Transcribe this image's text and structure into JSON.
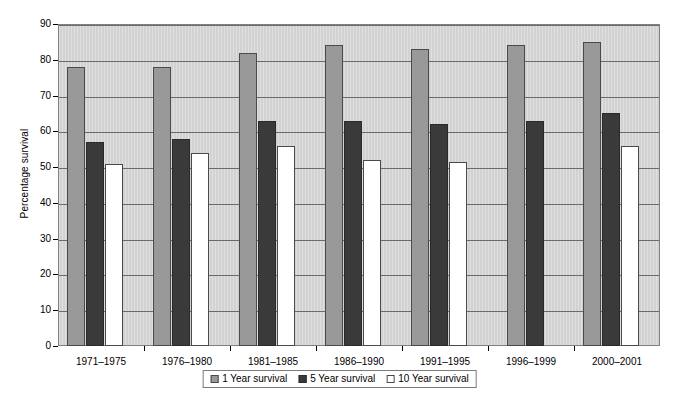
{
  "chart_data": {
    "type": "bar",
    "title": "",
    "xlabel": "",
    "ylabel": "Percentage survival",
    "ylim": [
      0,
      90
    ],
    "ytick_step": 10,
    "yticks": [
      0,
      10,
      20,
      30,
      40,
      50,
      60,
      70,
      80,
      90
    ],
    "ytick_labels": [
      "0",
      "10",
      "20",
      "30",
      "40",
      "50",
      "60",
      "70",
      "80",
      "90"
    ],
    "grid": true,
    "grid_axis": "y",
    "legend_position": "bottom-center",
    "categories": [
      "1971–1975",
      "1976–1980",
      "1981–1985",
      "1986–1990",
      "1991–1995",
      "1996–1999",
      "2000–2001"
    ],
    "series": [
      {
        "name": "1 Year survival",
        "color": "#999999",
        "values": [
          78,
          78,
          82,
          84,
          83,
          84,
          85
        ]
      },
      {
        "name": "5 Year survival",
        "color": "#3a3a3a",
        "values": [
          57,
          58,
          63,
          63,
          62,
          63,
          65
        ]
      },
      {
        "name": "10 Year survival",
        "color": "#ffffff",
        "values": [
          51,
          54,
          56,
          52,
          51.5,
          null,
          56
        ]
      }
    ],
    "plot_background": "#d2d2d2",
    "axis_color": "#000000",
    "gridline_color": "#6b6b6b"
  },
  "legend": {
    "items": [
      {
        "label": "1 Year survival",
        "swatch": "s1"
      },
      {
        "label": "5 Year survival",
        "swatch": "s2"
      },
      {
        "label": "10 Year survival",
        "swatch": "s3"
      }
    ]
  }
}
